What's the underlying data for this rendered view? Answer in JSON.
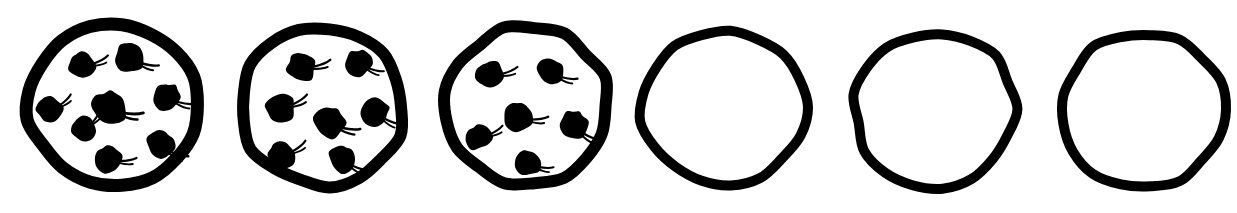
{
  "image": {
    "title": "Row of six hand-drawn cookies",
    "description": "Six hand-drawn circular cookies in a horizontal row; the first three contain chocolate chips and the last three are empty outlines.",
    "background_color": "#ffffff",
    "ink_color": "#000000",
    "width": 1237,
    "height": 213,
    "cookie_count": 6
  },
  "cookies": [
    {
      "index": 1,
      "name": "cookie-1",
      "label": "Cookie 1",
      "chip_count": 8,
      "has_chips": true,
      "center_x": 114,
      "center_y": 105,
      "radius_x": 86,
      "radius_y": 80,
      "outline_width": 13,
      "chips": [
        {
          "cx": -34,
          "cy": -43,
          "r": 16,
          "rot": -25
        },
        {
          "cx": 17,
          "cy": -52,
          "r": 17,
          "rot": 12
        },
        {
          "cx": -67,
          "cy": 2,
          "r": 15,
          "rot": -40
        },
        {
          "cx": -5,
          "cy": -2,
          "r": 20,
          "rot": 4
        },
        {
          "cx": 54,
          "cy": -12,
          "r": 16,
          "rot": 10
        },
        {
          "cx": -33,
          "cy": 22,
          "r": 15,
          "rot": -55
        },
        {
          "cx": 48,
          "cy": 36,
          "r": 17,
          "rot": 18
        },
        {
          "cx": -6,
          "cy": 50,
          "r": 16,
          "rot": -6
        }
      ]
    },
    {
      "index": 2,
      "name": "cookie-2",
      "label": "Cookie 2",
      "chip_count": 7,
      "has_chips": true,
      "center_x": 322,
      "center_y": 107,
      "radius_x": 82,
      "radius_y": 78,
      "outline_width": 12,
      "chips": [
        {
          "cx": -22,
          "cy": -44,
          "r": 17,
          "rot": -18
        },
        {
          "cx": 38,
          "cy": -48,
          "r": 15,
          "rot": 15
        },
        {
          "cx": -44,
          "cy": -3,
          "r": 17,
          "rot": -30
        },
        {
          "cx": 8,
          "cy": 11,
          "r": 18,
          "rot": 8
        },
        {
          "cx": 55,
          "cy": 1,
          "r": 16,
          "rot": 22
        },
        {
          "cx": -43,
          "cy": 45,
          "r": 16,
          "rot": -35
        },
        {
          "cx": 22,
          "cy": 48,
          "r": 16,
          "rot": 20
        }
      ]
    },
    {
      "index": 3,
      "name": "cookie-3",
      "label": "Cookie 3",
      "chip_count": 6,
      "has_chips": true,
      "center_x": 527,
      "center_y": 106,
      "radius_x": 82,
      "radius_y": 79,
      "outline_width": 12,
      "chips": [
        {
          "cx": -38,
          "cy": -35,
          "r": 16,
          "rot": -20
        },
        {
          "cx": 24,
          "cy": -38,
          "r": 16,
          "rot": 10
        },
        {
          "cx": -9,
          "cy": 7,
          "r": 17,
          "rot": -5
        },
        {
          "cx": 48,
          "cy": 15,
          "r": 17,
          "rot": 25
        },
        {
          "cx": -50,
          "cy": 28,
          "r": 15,
          "rot": -30
        },
        {
          "cx": 1,
          "cy": 53,
          "r": 15,
          "rot": 6
        }
      ]
    },
    {
      "index": 4,
      "name": "cookie-4",
      "label": "Cookie 4",
      "chip_count": 0,
      "has_chips": false,
      "center_x": 723,
      "center_y": 107,
      "radius_x": 82,
      "radius_y": 78,
      "outline_width": 10,
      "chips": []
    },
    {
      "index": 5,
      "name": "cookie-5",
      "label": "Cookie 5",
      "chip_count": 0,
      "has_chips": false,
      "center_x": 935,
      "center_y": 109,
      "radius_x": 80,
      "radius_y": 77,
      "outline_width": 10,
      "chips": []
    },
    {
      "index": 6,
      "name": "cookie-6",
      "label": "Cookie 6",
      "chip_count": 0,
      "has_chips": false,
      "center_x": 1143,
      "center_y": 110,
      "radius_x": 81,
      "radius_y": 78,
      "outline_width": 10,
      "chips": []
    }
  ]
}
